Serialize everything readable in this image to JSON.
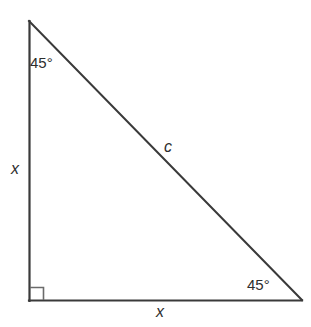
{
  "figure": {
    "kind": "right-triangle-diagram",
    "background_color": "#ffffff",
    "stroke_color": "#3a3a3a",
    "text_color": "#2e2e2e"
  },
  "geometry": {
    "vertices": {
      "top": {
        "x": 29,
        "y": 21
      },
      "bottom_left": {
        "x": 29,
        "y": 301
      },
      "bottom_right": {
        "x": 302,
        "y": 300
      }
    },
    "right_angle_marker": {
      "at": "bottom_left",
      "size": 14
    }
  },
  "labels": {
    "angle_top": "45°",
    "angle_bottom_right": "45°",
    "side_hypotenuse": "c",
    "side_vertical": "x",
    "side_horizontal": "x"
  }
}
